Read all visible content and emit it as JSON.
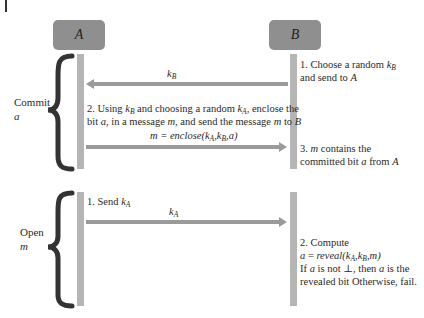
{
  "parties": {
    "a": {
      "label": "A"
    },
    "b": {
      "label": "B"
    }
  },
  "phases": {
    "commit": {
      "label": "Commit",
      "var": "a"
    },
    "open": {
      "label": "Open",
      "var": "m"
    }
  },
  "commit": {
    "step1": {
      "line1_pre": "1. Choose a random ",
      "k": "k",
      "k_sub": "B",
      "line2_pre": "and send to ",
      "target": "A"
    },
    "msg1": {
      "k": "k",
      "sub": "B"
    },
    "step2": {
      "l1_a": "2. Using ",
      "l1_k1": "k",
      "l1_k1_sub": "B",
      "l1_b": " and choosing a random ",
      "l1_k2": "k",
      "l1_k2_sub": "A",
      "l1_c": ", enclose the",
      "l2_a": "bit ",
      "l2_bit": "a",
      "l2_b": ", in a message ",
      "l2_m": "m",
      "l2_c": ", and send the message ",
      "l2_m2": "m",
      "l2_d": " to ",
      "l2_target": "B"
    },
    "msg2": {
      "lhs": "m",
      "eq": " = ",
      "fn": "enclose(",
      "k1": "k",
      "k1_sub": "A",
      "comma1": ",",
      "k2": "k",
      "k2_sub": "B",
      "comma2": ",",
      "bit": "a",
      "close": ")"
    },
    "step3": {
      "l1_a": "3. ",
      "l1_m": "m",
      "l1_b": " contains the",
      "l2_a": "committed bit ",
      "l2_bit": "a",
      "l2_b": " from ",
      "l2_src": "A"
    }
  },
  "open": {
    "step1": {
      "pre": "1. Send ",
      "k": "k",
      "sub": "A"
    },
    "msg1": {
      "k": "k",
      "sub": "A"
    },
    "step2": {
      "l1": "2. Compute",
      "l2_a": "a",
      "l2_eq": " = ",
      "l2_fn": "reveal(",
      "l2_k1": "k",
      "l2_k1_sub": "A",
      "l2_c1": ",",
      "l2_k2": "k",
      "l2_k2_sub": "B",
      "l2_c2": ",",
      "l2_m": "m",
      "l2_close": ")",
      "l3_a": "If ",
      "l3_bit": "a",
      "l3_b": " is not ⊥, then ",
      "l3_bit2": "a",
      "l3_c": " is the",
      "l4": "revealed bit Otherwise, fail."
    }
  },
  "colors": {
    "box": "#8f8f8f",
    "lifeline": "#b5b5b5",
    "arrow": "#9a9a9a",
    "brace": "#333333"
  }
}
